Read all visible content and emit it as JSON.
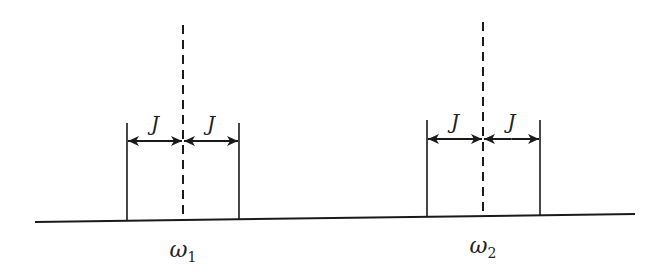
{
  "diagram": {
    "type": "spectral-line-splitting",
    "colors": {
      "line": "#1a1a1a",
      "background": "#ffffff"
    },
    "baseline": {
      "x1": 35,
      "y1": 222,
      "x2": 635,
      "y2": 214
    },
    "groups": [
      {
        "id": "group-1",
        "center_x": 183,
        "left_x": 127,
        "right_x": 239,
        "dashed_top_y": 25,
        "tick_top_y": 123,
        "arrow_y": 141,
        "spacing_labels": [
          "J",
          "J"
        ],
        "freq_label": {
          "symbol": "ω",
          "subscript": "1"
        }
      },
      {
        "id": "group-2",
        "center_x": 483,
        "left_x": 427,
        "right_x": 540,
        "dashed_top_y": 22,
        "tick_top_y": 120,
        "arrow_y": 139,
        "spacing_labels": [
          "J",
          "J"
        ],
        "freq_label": {
          "symbol": "ω",
          "subscript": "2"
        }
      }
    ]
  }
}
